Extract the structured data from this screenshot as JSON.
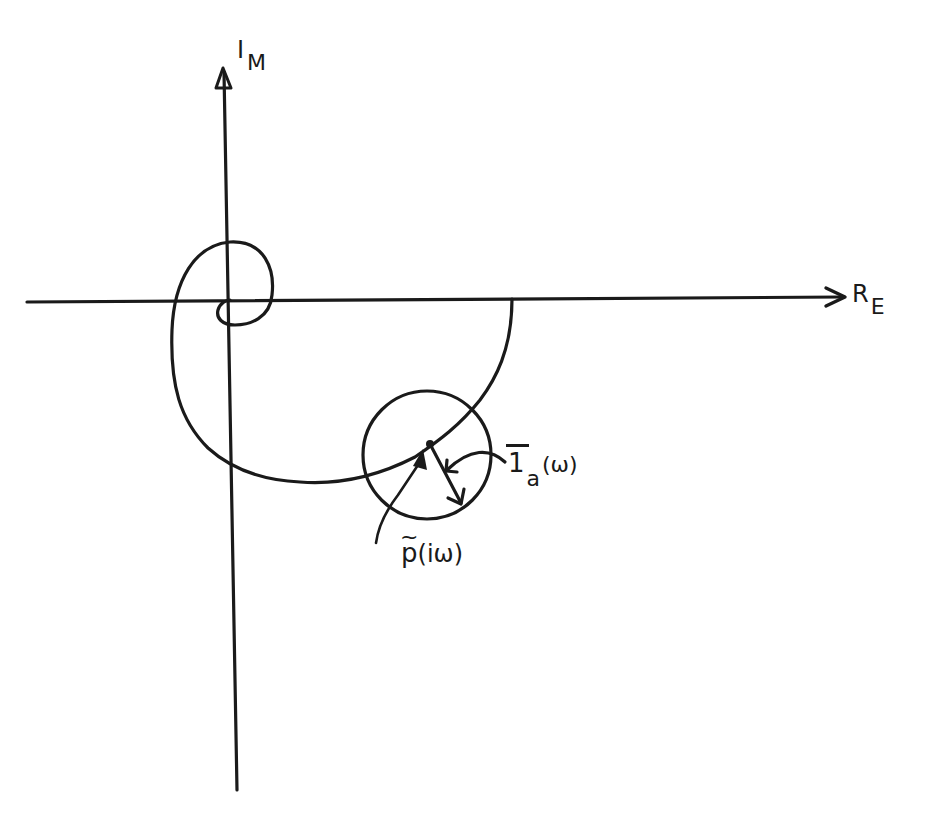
{
  "figure": {
    "type": "Nyquist-style complex plane diagram",
    "stroke_color": "#1a1a1a",
    "background": "#ffffff"
  },
  "axes": {
    "imaginary": {
      "main": "I",
      "subscript": "M"
    },
    "real": {
      "main": "R",
      "subscript": "E"
    }
  },
  "annotations": {
    "vector_label": {
      "main": "1",
      "subscript": "a",
      "argument": "(ω)",
      "overbar": true
    },
    "point_label": {
      "main": "p",
      "argument": "(iω)",
      "tilde": "~"
    }
  }
}
